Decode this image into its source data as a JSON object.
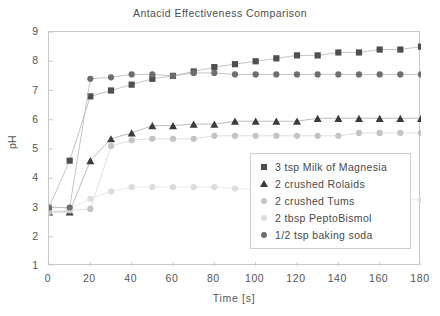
{
  "chart_data": {
    "type": "line",
    "title": "Antacid Effectiveness Comparison",
    "xlabel": "Time [s]",
    "ylabel": "pH",
    "xlim": [
      0,
      180
    ],
    "ylim": [
      1,
      9
    ],
    "xticks": [
      0,
      20,
      40,
      60,
      80,
      100,
      120,
      140,
      160,
      180
    ],
    "yticks": [
      1,
      2,
      3,
      4,
      5,
      6,
      7,
      8,
      9
    ],
    "grid": false,
    "legend_position": "inside-lower-right",
    "x": [
      0,
      10,
      20,
      30,
      40,
      50,
      60,
      70,
      80,
      90,
      100,
      110,
      120,
      130,
      140,
      150,
      160,
      170,
      180
    ],
    "series": [
      {
        "name": "3 tsp Milk of Magnesia",
        "marker": "square",
        "color": "#4f4f4f",
        "values": [
          3.0,
          4.6,
          6.8,
          7.0,
          7.2,
          7.4,
          7.5,
          7.65,
          7.8,
          7.9,
          8.0,
          8.1,
          8.2,
          8.2,
          8.3,
          8.3,
          8.4,
          8.4,
          8.5
        ]
      },
      {
        "name": "2 crushed Rolaids",
        "marker": "triangle",
        "color": "#3b3b3b",
        "values": [
          2.85,
          2.85,
          4.6,
          5.35,
          5.55,
          5.8,
          5.8,
          5.85,
          5.85,
          5.95,
          5.95,
          5.95,
          5.95,
          6.05,
          6.05,
          6.05,
          6.05,
          6.05,
          6.05
        ]
      },
      {
        "name": "2 crushed Tums",
        "marker": "circle",
        "color": "#c4c4c4",
        "values": [
          2.85,
          2.9,
          2.95,
          5.1,
          5.3,
          5.35,
          5.35,
          5.35,
          5.45,
          5.45,
          5.45,
          5.45,
          5.45,
          5.45,
          5.45,
          5.55,
          5.55,
          5.55,
          5.55
        ]
      },
      {
        "name": "2 tbsp PeptoBismol",
        "marker": "circle",
        "color": "#dcdcdc",
        "values": [
          3.05,
          2.95,
          3.3,
          3.55,
          3.7,
          3.7,
          3.7,
          3.7,
          3.7,
          3.65,
          3.6,
          3.45,
          3.45,
          3.4,
          3.4,
          3.35,
          3.3,
          3.3,
          3.25
        ]
      },
      {
        "name": "1/2 tsp baking soda",
        "marker": "circle",
        "color": "#6e6e6e",
        "values": [
          3.0,
          3.0,
          7.4,
          7.45,
          7.55,
          7.55,
          7.5,
          7.6,
          7.6,
          7.55,
          7.55,
          7.55,
          7.55,
          7.55,
          7.55,
          7.55,
          7.55,
          7.55,
          7.55
        ]
      }
    ]
  }
}
